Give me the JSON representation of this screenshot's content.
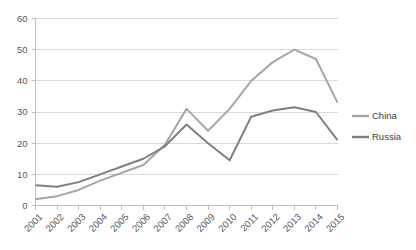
{
  "chart_data": {
    "type": "line",
    "title": "",
    "subtitle": "",
    "xlabel": "",
    "ylabel": "",
    "categories": [
      "2001",
      "2002",
      "2003",
      "2004",
      "2005",
      "2006",
      "2007",
      "2008",
      "2009",
      "2010",
      "2011",
      "2012",
      "2013",
      "2014",
      "2015"
    ],
    "x": [
      2001,
      2002,
      2003,
      2004,
      2005,
      2006,
      2007,
      2008,
      2009,
      2010,
      2011,
      2012,
      2013,
      2014,
      2015
    ],
    "series": [
      {
        "name": "China",
        "color": "#a6a6a6",
        "values": [
          2,
          3,
          5,
          8,
          10.5,
          13,
          19.5,
          31,
          24,
          31,
          40,
          46,
          50,
          47,
          33
        ]
      },
      {
        "name": "Russia",
        "color": "#7f7f7f",
        "values": [
          6.5,
          6,
          7.5,
          10,
          12.5,
          15,
          19,
          26,
          20,
          14.5,
          28.5,
          30.5,
          31.5,
          30,
          21
        ]
      }
    ],
    "ylim": [
      0,
      60
    ],
    "yticks": [
      0,
      10,
      20,
      30,
      40,
      50,
      60
    ],
    "ytick_labels": [
      "0",
      "10",
      "20",
      "30",
      "40",
      "50",
      "60"
    ],
    "grid": true,
    "grid_axis": "y",
    "legend": {
      "position": "right",
      "entries": [
        {
          "label": "China",
          "color": "#a6a6a6"
        },
        {
          "label": "Russia",
          "color": "#7f7f7f"
        }
      ]
    }
  }
}
